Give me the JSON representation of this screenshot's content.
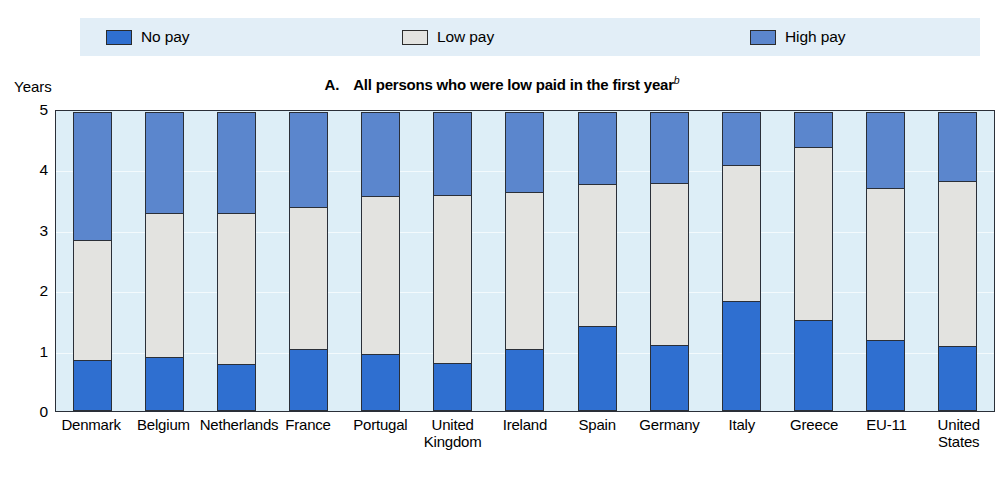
{
  "axis_unit_label": "Years",
  "panel": {
    "letter": "A.",
    "title": "All persons who were low paid in the first year",
    "footnote_marker": "b"
  },
  "legend": {
    "items": [
      {
        "label": "No pay",
        "color": "#2f6fd0",
        "key": "no_pay"
      },
      {
        "label": "Low pay",
        "color": "#e3e3e0",
        "key": "low_pay"
      },
      {
        "label": "High pay",
        "color": "#5b86cd",
        "key": "high_pay"
      }
    ]
  },
  "chart_data": {
    "type": "bar",
    "stacked": true,
    "xlabel": "",
    "ylabel": "Years",
    "ylim": [
      0,
      5
    ],
    "yticks": [
      0,
      1,
      2,
      3,
      4,
      5
    ],
    "ytick_labels": [
      "0",
      "1",
      "2",
      "3",
      "4",
      "5"
    ],
    "grid": true,
    "legend_position": "top",
    "categories": [
      "Denmark",
      "Belgium",
      "Netherlands",
      "France",
      "Portugal",
      "United Kingdom",
      "Ireland",
      "Spain",
      "Germany",
      "Italy",
      "Greece",
      "EU-11",
      "United States"
    ],
    "category_lines": [
      [
        "Denmark"
      ],
      [
        "Belgium"
      ],
      [
        "Netherlands"
      ],
      [
        "France"
      ],
      [
        "Portugal"
      ],
      [
        "United",
        "Kingdom"
      ],
      [
        "Ireland"
      ],
      [
        "Spain"
      ],
      [
        "Germany"
      ],
      [
        "Italy"
      ],
      [
        "Greece"
      ],
      [
        "EU-11"
      ],
      [
        "United",
        "States"
      ]
    ],
    "series": [
      {
        "name": "No pay",
        "color": "#2f6fd0",
        "values": [
          0.85,
          0.9,
          0.78,
          1.02,
          0.95,
          0.8,
          1.02,
          1.4,
          1.1,
          1.82,
          1.5,
          1.18,
          1.08
        ]
      },
      {
        "name": "Low pay",
        "color": "#e3e3e0",
        "values": [
          2.0,
          2.4,
          2.52,
          2.38,
          2.63,
          2.8,
          2.63,
          2.38,
          2.7,
          2.28,
          2.9,
          2.54,
          2.75
        ]
      },
      {
        "name": "High pay",
        "color": "#5b86cd",
        "values": [
          2.15,
          1.7,
          1.7,
          1.6,
          1.42,
          1.4,
          1.35,
          1.22,
          1.2,
          0.9,
          0.6,
          1.28,
          1.17
        ]
      }
    ],
    "cumulative_tops": {
      "no_pay": [
        0.85,
        0.9,
        0.78,
        1.02,
        0.95,
        0.8,
        1.02,
        1.4,
        1.1,
        1.82,
        1.5,
        1.18,
        1.08
      ],
      "low_pay": [
        2.85,
        3.3,
        3.3,
        3.4,
        3.58,
        3.6,
        3.65,
        3.78,
        3.8,
        4.1,
        4.4,
        3.72,
        3.83
      ],
      "total": [
        5.0,
        5.0,
        5.0,
        5.0,
        5.0,
        5.0,
        5.0,
        5.0,
        5.0,
        5.0,
        5.0,
        5.0,
        5.0
      ]
    }
  }
}
